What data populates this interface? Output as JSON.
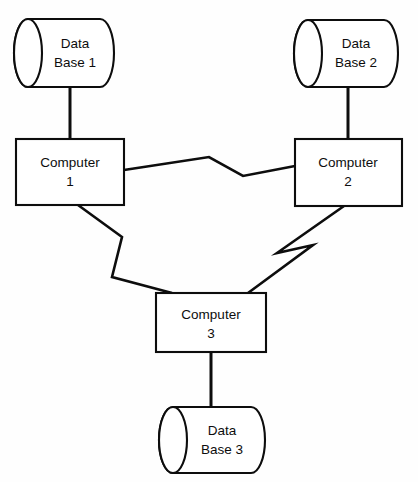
{
  "diagram": {
    "kind": "network-topology-diagram",
    "background_color": "#fefefe",
    "stroke_color": "#0d0d0d",
    "fill_color": "#ffffff",
    "canvas": {
      "width": 418,
      "height": 482
    },
    "nodes": {
      "database_1": {
        "label_line1": "Data",
        "label_line2": "Base 1",
        "shape": "cylinder",
        "orientation": "horizontal",
        "x": 14,
        "y": 19,
        "width": 100,
        "height": 68
      },
      "database_2": {
        "label_line1": "Data",
        "label_line2": "Base 2",
        "shape": "cylinder",
        "orientation": "horizontal",
        "x": 294,
        "y": 20,
        "width": 104,
        "height": 67
      },
      "database_3": {
        "label_line1": "Data",
        "label_line2": "Base 3",
        "shape": "cylinder",
        "orientation": "horizontal",
        "x": 159,
        "y": 407,
        "width": 106,
        "height": 66
      },
      "computer_1": {
        "label_line1": "Computer",
        "label_line2": "1",
        "shape": "rectangle",
        "x": 16,
        "y": 139,
        "width": 108,
        "height": 66
      },
      "computer_2": {
        "label_line1": "Computer",
        "label_line2": "2",
        "shape": "rectangle",
        "x": 295,
        "y": 139,
        "width": 107,
        "height": 67
      },
      "computer_3": {
        "label_line1": "Computer",
        "label_line2": "3",
        "shape": "rectangle",
        "x": 156,
        "y": 293,
        "width": 110,
        "height": 59
      }
    },
    "links": [
      {
        "name": "db1-to-computer1",
        "from": "database_1",
        "to": "computer_1",
        "style": "straight",
        "points": "70,87 70,139"
      },
      {
        "name": "db2-to-computer2",
        "from": "database_2",
        "to": "computer_2",
        "style": "straight",
        "points": "348,87 348,139"
      },
      {
        "name": "computer3-to-db3",
        "from": "computer_3",
        "to": "database_3",
        "style": "straight",
        "points": "211,352 211,407"
      },
      {
        "name": "computer1-to-computer2",
        "from": "computer_1",
        "to": "computer_2",
        "style": "zigzag",
        "points": "124,170 209,157 243,176 295,166"
      },
      {
        "name": "computer1-to-computer3",
        "from": "computer_1",
        "to": "computer_3",
        "style": "zigzag",
        "points": "78,205 122,237 112,277 172,293"
      },
      {
        "name": "computer2-to-computer3",
        "from": "computer_2",
        "to": "computer_3",
        "style": "zigzag",
        "points": "344,206 277,253 313,245 248,293"
      }
    ]
  }
}
